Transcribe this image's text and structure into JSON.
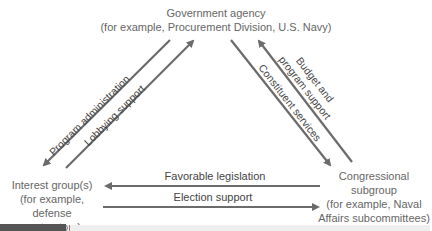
{
  "diagram": {
    "nodes": {
      "agency": {
        "title": "Government agency",
        "example": "(for example, Procurement Division, U.S. Navy)"
      },
      "interest_group": {
        "title": "Interest group(s)",
        "example_line1": "(for example, defense",
        "example_line2": "contractors)"
      },
      "congress": {
        "title_line1": "Congressional",
        "title_line2": "subgroup",
        "example_line1": "(for example, Naval",
        "example_line2": "Affairs subcommittees)"
      }
    },
    "edges": [
      {
        "id": "program-administration",
        "label": "Program administration",
        "from": "Government agency",
        "to": "Interest group(s)"
      },
      {
        "id": "lobbying-support",
        "label": "Lobbying support",
        "from": "Interest group(s)",
        "to": "Government agency"
      },
      {
        "id": "constituent-services",
        "label": "Constituent services",
        "from": "Government agency",
        "to": "Congressional subgroup"
      },
      {
        "id": "budget-program-support",
        "label_line1": "Budget and",
        "label_line2": "program support",
        "from": "Congressional subgroup",
        "to": "Government agency"
      },
      {
        "id": "favorable-legislation",
        "label": "Favorable legislation",
        "from": "Congressional subgroup",
        "to": "Interest group(s)"
      },
      {
        "id": "election-support",
        "label": "Election support",
        "from": "Interest group(s)",
        "to": "Congressional subgroup"
      }
    ],
    "colors": {
      "arrow": "#6b6b6b",
      "text": "#666666",
      "label": "#444444"
    }
  }
}
